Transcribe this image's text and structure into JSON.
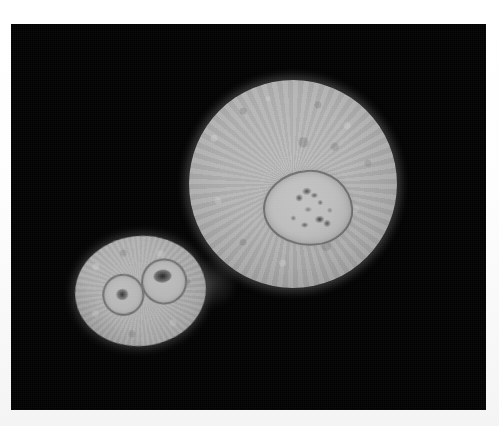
{
  "image": {
    "kind": "micrograph",
    "modality": "phase-contrast light micrograph",
    "color_mode": "grayscale",
    "background_color": "#010101",
    "border_color": "#ffffff",
    "canvas": {
      "width": 499,
      "height": 426
    },
    "field_of_view": {
      "x": 11,
      "y": 24,
      "width": 475,
      "height": 386
    }
  },
  "objects": [
    {
      "id": "cell-large",
      "label": "large round cell",
      "shape": "circle",
      "center": {
        "x": 293,
        "y": 184
      },
      "diameter_px": 208,
      "fill_color": "#b0b0b0",
      "edge": "fuzzy granular halo",
      "children": [
        {
          "id": "nucleus-large",
          "label": "nucleus",
          "shape": "irregular oval",
          "center": {
            "x": 308,
            "y": 208
          },
          "width_px": 90,
          "height_px": 76,
          "rim_color": "#4a4a4a",
          "fill_color": "#bdbdbd",
          "granule_count": 10
        }
      ]
    },
    {
      "id": "cell-small",
      "label": "small binucleate cell",
      "shape": "ellipse",
      "center": {
        "x": 140,
        "y": 291
      },
      "width_px": 131,
      "height_px": 110,
      "rotation_deg": -6,
      "fill_color": "#a8a8a8",
      "edge": "fuzzy granular halo",
      "children": [
        {
          "id": "nucleus-small-left",
          "label": "left nucleus",
          "shape": "ring",
          "center": {
            "x": 122,
            "y": 293
          },
          "diameter_px": 42,
          "rim_color": "#4b4b4b",
          "has_central_dot": true
        },
        {
          "id": "nucleus-small-right",
          "label": "right nucleus",
          "shape": "ring",
          "center": {
            "x": 164,
            "y": 284
          },
          "diameter_px": 46,
          "rim_color": "#4b4b4b",
          "has_central_dot": true
        }
      ]
    }
  ],
  "annotations": {
    "visible_text": [],
    "scale_bar": null,
    "labels": []
  }
}
